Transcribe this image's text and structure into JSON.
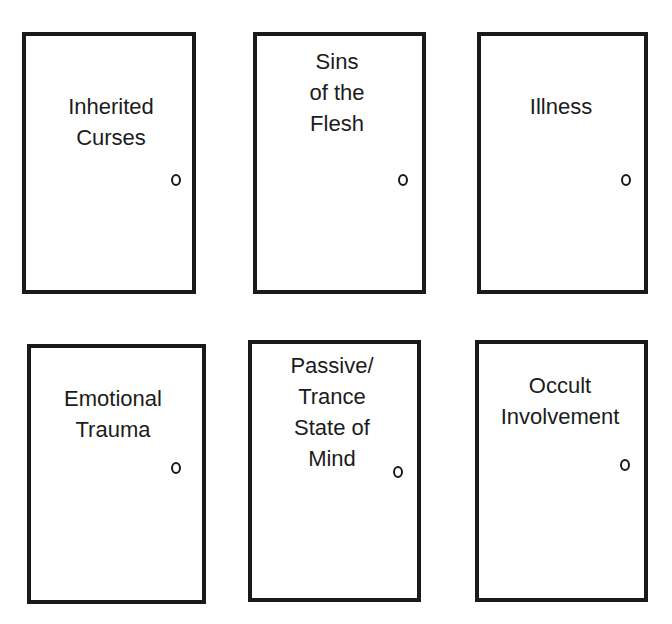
{
  "diagram": {
    "title": "",
    "doors": [
      {
        "id": "inherited-curses",
        "lines": [
          "Inherited",
          "Curses"
        ],
        "box": {
          "left": 22,
          "top": 32,
          "width": 174,
          "height": 262
        },
        "label_pos": {
          "left": 30,
          "top": 55,
          "width": 110
        },
        "knob_pos": {
          "left": 145,
          "top": 138
        }
      },
      {
        "id": "sins-of-the-flesh",
        "lines": [
          "Sins",
          "of the",
          "Flesh"
        ],
        "box": {
          "left": 253,
          "top": 32,
          "width": 173,
          "height": 262
        },
        "label_pos": {
          "left": 30,
          "top": 10,
          "width": 100
        },
        "knob_pos": {
          "left": 141,
          "top": 138
        }
      },
      {
        "id": "illness",
        "lines": [
          "Illness"
        ],
        "box": {
          "left": 477,
          "top": 32,
          "width": 171,
          "height": 262
        },
        "label_pos": {
          "left": 40,
          "top": 55,
          "width": 80
        },
        "knob_pos": {
          "left": 140,
          "top": 138
        }
      },
      {
        "id": "emotional-trauma",
        "lines": [
          "Emotional",
          "Trauma"
        ],
        "box": {
          "left": 27,
          "top": 344,
          "width": 179,
          "height": 260
        },
        "label_pos": {
          "left": 22,
          "top": 35,
          "width": 120
        },
        "knob_pos": {
          "left": 140,
          "top": 114
        }
      },
      {
        "id": "passive-trance-state-of-mind",
        "lines": [
          "Passive/",
          "Trance",
          "State of",
          "Mind"
        ],
        "box": {
          "left": 248,
          "top": 340,
          "width": 173,
          "height": 262
        },
        "label_pos": {
          "left": 25,
          "top": 6,
          "width": 110
        },
        "knob_pos": {
          "left": 141,
          "top": 122
        }
      },
      {
        "id": "occult-involvement",
        "lines": [
          "Occult",
          "Involvement"
        ],
        "box": {
          "left": 475,
          "top": 340,
          "width": 173,
          "height": 262
        },
        "label_pos": {
          "left": 6,
          "top": 26,
          "width": 150
        },
        "knob_pos": {
          "left": 141,
          "top": 115
        }
      }
    ],
    "colors": {
      "stroke": "#1a1a1a",
      "text": "#1c1c1c",
      "background": "#ffffff"
    }
  }
}
